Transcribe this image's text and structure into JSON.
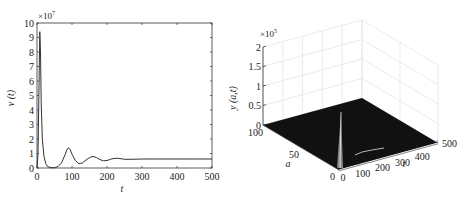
{
  "chart_data": [
    {
      "type": "line",
      "title": "",
      "xlabel": "t",
      "ylabel": "v (t)",
      "y_multiplier": "×10^7",
      "xlim": [
        0,
        500
      ],
      "ylim": [
        0,
        10
      ],
      "xticks": [
        0,
        100,
        200,
        300,
        400,
        500
      ],
      "yticks": [
        0,
        1,
        2,
        3,
        4,
        5,
        6,
        7,
        8,
        9,
        10
      ],
      "grid": false,
      "legend": null,
      "series": [
        {
          "name": "v(t)",
          "x": [
            0,
            3,
            6,
            8,
            10,
            12,
            15,
            20,
            25,
            30,
            40,
            50,
            60,
            70,
            80,
            85,
            90,
            95,
            100,
            110,
            120,
            130,
            140,
            150,
            160,
            170,
            180,
            190,
            200,
            210,
            220,
            230,
            240,
            250,
            260,
            280,
            300,
            350,
            400,
            450,
            500
          ],
          "values": [
            0,
            1.0,
            6.0,
            9.4,
            8.0,
            4.5,
            2.0,
            0.8,
            0.3,
            0.1,
            0.02,
            0.02,
            0.1,
            0.35,
            0.9,
            1.25,
            1.4,
            1.25,
            0.95,
            0.5,
            0.3,
            0.35,
            0.55,
            0.72,
            0.8,
            0.72,
            0.58,
            0.5,
            0.52,
            0.6,
            0.66,
            0.67,
            0.64,
            0.6,
            0.6,
            0.61,
            0.62,
            0.62,
            0.62,
            0.62,
            0.62
          ]
        }
      ]
    },
    {
      "type": "surface3d",
      "title": "",
      "xlabel": "t",
      "ylabel": "a",
      "zlabel": "y (a,t)",
      "z_multiplier": "×10^5",
      "xlim": [
        0,
        500
      ],
      "ylim": [
        0,
        100
      ],
      "zlim": [
        0,
        2
      ],
      "xticks": [
        0,
        100,
        200,
        300,
        400,
        500
      ],
      "yticks": [
        0,
        50,
        100
      ],
      "zticks": [
        0,
        0.5,
        1,
        1.5,
        2
      ],
      "grid": true,
      "description": "Surface is near zero everywhere except a sharp spike near t≈10, a≈0 reaching about 1.0×10^5, with a small secondary bump near t≈90."
    }
  ],
  "left": {
    "multiplier_base": "×10",
    "multiplier_exp": "7",
    "ylabel": "v (t)",
    "xlabel": "t",
    "xticks": [
      "0",
      "100",
      "200",
      "300",
      "400",
      "500"
    ],
    "yticks": [
      "0",
      "1",
      "2",
      "3",
      "4",
      "5",
      "6",
      "7",
      "8",
      "9",
      "10"
    ]
  },
  "right": {
    "multiplier_base": "×10",
    "multiplier_exp": "5",
    "zlabel": "y (a,t)",
    "alabel": "a",
    "tlabel": "t",
    "zticks": [
      "0",
      "0.5",
      "1",
      "1.5",
      "2"
    ],
    "aticks": [
      "100",
      "50",
      "0"
    ],
    "tticks": [
      "0",
      "100",
      "200",
      "300",
      "400",
      "500"
    ]
  }
}
